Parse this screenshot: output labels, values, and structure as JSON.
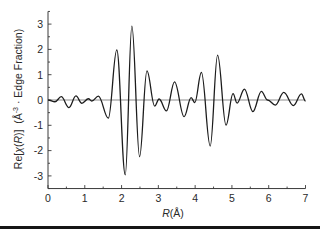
{
  "chart_data": {
    "type": "line",
    "title": "",
    "xlabel": "R(Å)",
    "ylabel": "Re[χ(R)]  (Å⁻³ · Edge Fraction)",
    "xlim": [
      0,
      7
    ],
    "ylim": [
      -3.5,
      3.5
    ],
    "xticks": [
      0,
      1,
      2,
      3,
      4,
      5,
      6,
      7
    ],
    "xtick_labels": [
      "0",
      "1",
      "2",
      "3",
      "4",
      "5",
      "6",
      "7"
    ],
    "yticks": [
      -3,
      -2,
      -1,
      0,
      1,
      2,
      3
    ],
    "ytick_labels": [
      "-3",
      "-2",
      "-1",
      "0",
      "1",
      "2",
      "3"
    ],
    "minor_ticks": true,
    "grid": false,
    "legend": null,
    "zero_line": true,
    "series": [
      {
        "name": "Re[χ(R)]",
        "x": [
          0.0,
          0.19,
          0.36,
          0.57,
          0.76,
          0.92,
          1.1,
          1.19,
          1.37,
          1.64,
          1.87,
          2.1,
          2.28,
          2.49,
          2.69,
          2.9,
          3.02,
          3.22,
          3.44,
          3.7,
          3.89,
          3.99,
          4.17,
          4.41,
          4.61,
          4.84,
          5.03,
          5.14,
          5.34,
          5.57,
          5.8,
          5.97,
          6.18,
          6.41,
          6.67,
          6.89,
          7.0
        ],
        "y": [
          0.0,
          -0.07,
          0.13,
          -0.3,
          0.16,
          -0.13,
          0.05,
          -0.04,
          0.15,
          -0.72,
          1.98,
          -2.96,
          2.92,
          -2.24,
          1.15,
          -0.24,
          0.04,
          -0.43,
          0.72,
          -0.66,
          0.09,
          -0.1,
          1.09,
          -1.82,
          1.77,
          -0.99,
          0.25,
          -0.12,
          0.43,
          -0.46,
          0.34,
          0.0,
          -0.2,
          0.3,
          -0.22,
          0.24,
          -0.04
        ]
      }
    ]
  },
  "labels": {
    "xlabel_parts": [
      {
        "text": "R",
        "italic": true
      },
      {
        "text": "(Å)",
        "italic": false
      }
    ],
    "ylabel_parts": [
      {
        "text": "Re[",
        "italic": false
      },
      {
        "text": "χ",
        "italic": true
      },
      {
        "text": "(",
        "italic": false
      },
      {
        "text": "R",
        "italic": true
      },
      {
        "text": ")]",
        "italic": false
      },
      {
        "text": "  (Å",
        "italic": false
      },
      {
        "text": "-3",
        "italic": false,
        "superscript": true
      },
      {
        "text": " · Edge Fraction)",
        "italic": false
      }
    ]
  },
  "colors": {
    "curve": "#1c1c1c",
    "zero_line": "#8c8c8c",
    "axis": "#3a3a3a",
    "rule": "#151515"
  }
}
